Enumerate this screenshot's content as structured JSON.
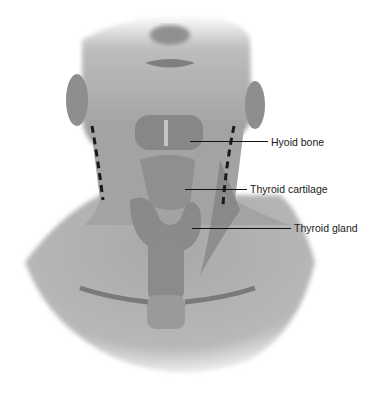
{
  "figure": {
    "colors": {
      "background": "#ffffff",
      "skin": "#a9a9a9",
      "skin_dark": "#7d7d7d",
      "leader_line": "#111111",
      "dashed_line": "#1a1a1a"
    }
  },
  "labels": [
    {
      "text": "Hyoid bone",
      "x": 271,
      "y": 136,
      "line_x1": 190,
      "line_x2": 268,
      "line_y": 142
    },
    {
      "text": "Thyroid cartilage",
      "x": 250,
      "y": 183,
      "line_x1": 185,
      "line_x2": 247,
      "line_y": 189
    },
    {
      "text": "Thyroid gland",
      "x": 294,
      "y": 222,
      "line_x1": 192,
      "line_x2": 291,
      "line_y": 228
    }
  ]
}
